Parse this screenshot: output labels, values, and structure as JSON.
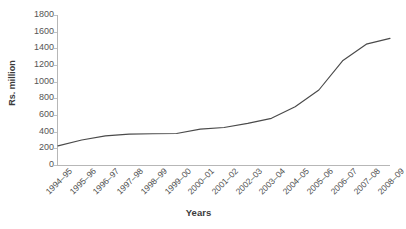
{
  "chart_data": {
    "type": "line",
    "title": "",
    "xlabel": "Years",
    "ylabel": "Rs. million",
    "ylim": [
      0,
      1800
    ],
    "ytick_step": 200,
    "grid": false,
    "legend": "none",
    "line_color": "#4a4a4a",
    "axis_color": "#b7b7b7",
    "categories": [
      "1994–95",
      "1995–96",
      "1996–97",
      "1997–98",
      "1998–99",
      "1999–00",
      "2000–01",
      "2001–02",
      "2002–03",
      "2003–04",
      "2004–05",
      "2005–06",
      "2006–07",
      "2007–08",
      "2008–09"
    ],
    "values": [
      230,
      300,
      350,
      370,
      375,
      378,
      430,
      450,
      500,
      560,
      700,
      900,
      1250,
      1450,
      1520
    ],
    "yticks": [
      0,
      200,
      400,
      600,
      800,
      1000,
      1200,
      1400,
      1600,
      1800
    ],
    "series": [
      {
        "name": "Rs. million",
        "values": [
          230,
          300,
          350,
          370,
          375,
          378,
          430,
          450,
          500,
          560,
          700,
          900,
          1250,
          1450,
          1520
        ]
      }
    ]
  },
  "axes": {
    "y_title": "Rs. million",
    "x_title": "Years"
  }
}
